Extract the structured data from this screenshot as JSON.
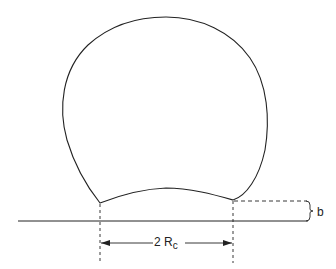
{
  "diagram": {
    "type": "drop-on-surface",
    "labels": {
      "contact_width": "2 R",
      "contact_width_sub": "c",
      "gap": "b"
    },
    "colors": {
      "stroke": "#222222",
      "background": "#ffffff"
    }
  }
}
